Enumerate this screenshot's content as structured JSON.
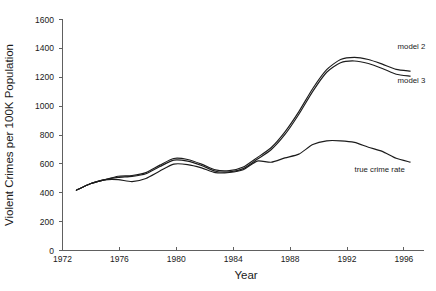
{
  "chart_data": {
    "type": "line",
    "title": "",
    "xlabel": "Year",
    "ylabel": "Violent Crimes per 100K Population",
    "xlim": [
      1972,
      1998
    ],
    "ylim": [
      0,
      1600
    ],
    "ytick_step": 200,
    "grid": false,
    "legend_position": "inline-right-of-lines",
    "xticks": [
      1972,
      1976,
      1980,
      1984,
      1988,
      1992,
      1996
    ],
    "xtick_labels": [
      "1972",
      "1976",
      "1980",
      "1984",
      "1988",
      "1992",
      "1996"
    ],
    "yticks": [
      0,
      200,
      400,
      600,
      800,
      1000,
      1200,
      1400,
      1600
    ],
    "ytick_labels": [
      "0",
      "200",
      "400",
      "600",
      "800",
      "1000",
      "1200",
      "1400",
      "1600"
    ],
    "x": [
      1973,
      1974,
      1975,
      1976,
      1977,
      1978,
      1979,
      1980,
      1981,
      1982,
      1983,
      1984,
      1985,
      1986,
      1987,
      1988,
      1989,
      1990,
      1991,
      1992,
      1993,
      1994,
      1995,
      1996,
      1997
    ],
    "series": [
      {
        "name": "model 2",
        "label": "model 2",
        "color": "#1c1c1c",
        "values": [
          417,
          461,
          488,
          490,
          476,
          498,
          549,
          597,
          594,
          571,
          538,
          539,
          558,
          618,
          610,
          640,
          666,
          732,
          758,
          758,
          747,
          714,
          685,
          637,
          611
        ]
      },
      {
        "name": "model 3",
        "label": "model 3",
        "color": "#1c1c1c",
        "values": [
          417,
          461,
          488,
          513,
          518,
          538,
          590,
          636,
          629,
          597,
          557,
          552,
          577,
          642,
          710,
          820,
          960,
          1120,
          1250,
          1320,
          1335,
          1320,
          1288,
          1252,
          1240
        ]
      },
      {
        "name": "true crime rate",
        "label": "true crime rate",
        "color": "#1c1c1c",
        "values": [
          417,
          461,
          488,
          505,
          512,
          530,
          580,
          625,
          618,
          588,
          548,
          543,
          566,
          630,
          696,
          802,
          942,
          1100,
          1232,
          1298,
          1310,
          1292,
          1258,
          1218,
          1205
        ]
      }
    ],
    "annotations": [
      {
        "text": "model 2",
        "x": 1996.1,
        "y": 1390
      },
      {
        "text": "model 3",
        "x": 1996.1,
        "y": 1160
      },
      {
        "text": "true crime rate",
        "x": 1993.0,
        "y": 545
      }
    ]
  }
}
